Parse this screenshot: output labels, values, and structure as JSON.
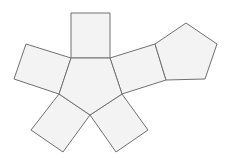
{
  "diagram": {
    "type": "geometric-net",
    "colors": {
      "background": "#ffffff",
      "face_fill": "#f3f3f3",
      "edge_stroke": "#707070"
    },
    "faces": [
      {
        "name": "center-pentagon",
        "shape": "pentagon",
        "points": "71,58 110,58 122,94 90,115 59,94"
      },
      {
        "name": "top-square",
        "shape": "square",
        "points": "71,13 110,13 110,58 71,58"
      },
      {
        "name": "left-square",
        "shape": "square",
        "points": "71,58 59,94 14,79 26,44"
      },
      {
        "name": "upper-right-square",
        "shape": "square",
        "points": "110,58 155,44 166,80 122,94"
      },
      {
        "name": "right-pentagon",
        "shape": "pentagon",
        "points": "155,44 186,23 217,44 205,79 166,80"
      },
      {
        "name": "bottom-left-square",
        "shape": "square",
        "points": "59,94 90,115 63,152 31,130"
      },
      {
        "name": "bottom-right-square",
        "shape": "square",
        "points": "90,115 122,94 148,130 116,152"
      }
    ]
  }
}
